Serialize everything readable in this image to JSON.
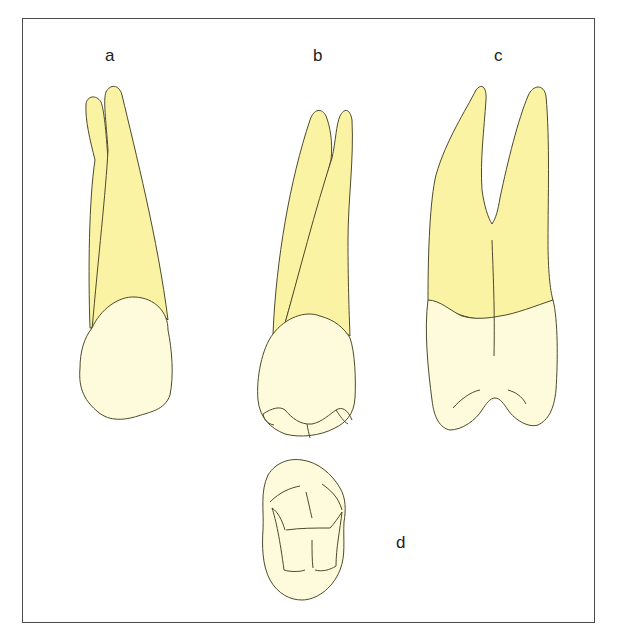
{
  "figure": {
    "labels": {
      "a": "a",
      "b": "b",
      "c": "c",
      "d": "d"
    },
    "views": [
      {
        "id": "a",
        "description": "tooth view a — two roots, rounded crown"
      },
      {
        "id": "b",
        "description": "tooth view b — two roots, crown with occlusal ridges"
      },
      {
        "id": "c",
        "description": "tooth view c — bifurcated roots, crown with two cusps"
      },
      {
        "id": "d",
        "description": "tooth view d — occlusal view"
      }
    ],
    "colors": {
      "root": "#FBF3A4",
      "crown": "#FDFBDC",
      "outline": "#4d4a2c",
      "frame": "#4a4a4a",
      "background": "#ffffff"
    }
  }
}
